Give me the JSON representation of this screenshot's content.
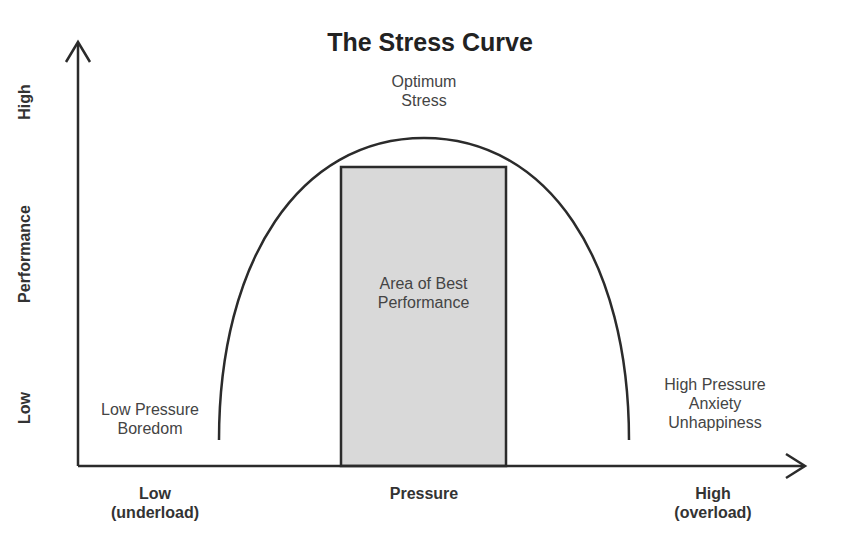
{
  "title": "The Stress Curve",
  "peak_label": {
    "line1": "Optimum",
    "line2": "Stress"
  },
  "zone_label": {
    "line1": "Area of Best",
    "line2": "Performance"
  },
  "left_label": {
    "line1": "Low Pressure",
    "line2": "Boredom"
  },
  "right_label": {
    "line1": "High Pressure",
    "line2": "Anxiety",
    "line3": "Unhappiness"
  },
  "y_axis": {
    "label": "Performance",
    "high": "High",
    "low": "Low"
  },
  "x_axis": {
    "label": "Pressure",
    "low": {
      "line1": "Low",
      "line2": "(underload)"
    },
    "high": {
      "line1": "High",
      "line2": "(overload)"
    }
  },
  "colors": {
    "line": "#2b2b2b",
    "zone_fill": "#d8d8d8",
    "background": "#ffffff"
  }
}
